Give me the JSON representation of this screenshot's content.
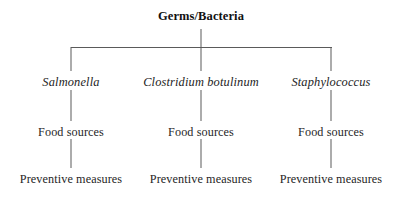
{
  "diagram": {
    "title": "Germs/Bacteria",
    "type": "hierarchy-tree",
    "levels": 4,
    "background_color": "#ffffff",
    "line_color": "#5a5a5a",
    "text_color": "#242424",
    "root": {
      "label": "Germs/Bacteria",
      "style": "bold",
      "x": 201,
      "y": 15
    },
    "branches": [
      {
        "species": "Salmonella",
        "species_style": "italic",
        "food_sources": "Food sources",
        "preventive_measures": "Preventive measures",
        "x": 71
      },
      {
        "species": "Clostridium botulinum",
        "species_style": "italic",
        "food_sources": "Food sources",
        "preventive_measures": "Preventive measures",
        "x": 201
      },
      {
        "species": "Staphylococcus",
        "species_style": "italic",
        "food_sources": "Food sources",
        "preventive_measures": "Preventive measures",
        "x": 331
      }
    ],
    "row_baselines": {
      "root": 15,
      "species": 83,
      "food_sources": 133,
      "preventive_measures": 180
    },
    "bus_bar": {
      "y": 47,
      "x_start": 71,
      "x_end": 331
    }
  }
}
